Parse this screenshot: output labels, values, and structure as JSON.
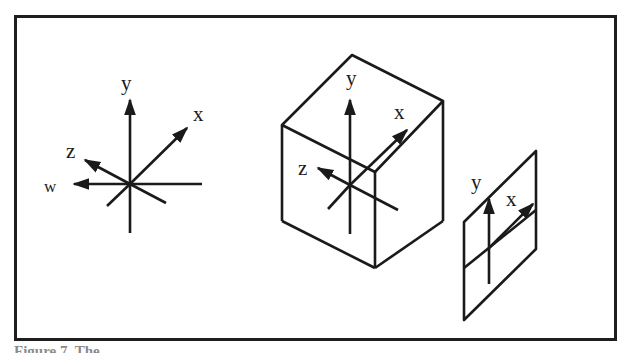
{
  "figure": {
    "frame_color": "#1e1e1e",
    "line_color": "#1a1a1a",
    "panels": [
      {
        "name": "four-axis-coordinate-system",
        "labels": {
          "y": "y",
          "x": "x",
          "z": "z",
          "w": "w"
        }
      },
      {
        "name": "cube-with-3d-axes",
        "labels": {
          "y": "y",
          "x": "x",
          "z": "z"
        }
      },
      {
        "name": "plane-with-2d-axes",
        "labels": {
          "y": "y",
          "x": "x"
        }
      }
    ],
    "caption": "Figure 7. The"
  }
}
